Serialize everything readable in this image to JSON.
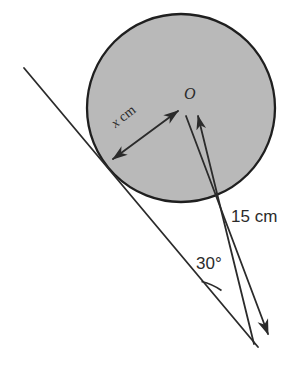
{
  "diagram": {
    "background_color": "#ffffff",
    "stroke_color": "#2b2b2b",
    "circle": {
      "name": "shaded-circle",
      "center_x": 181,
      "center_y": 108,
      "radius": 94,
      "fill_color": "#b9b9b9",
      "stroke_color": "#1f1f1f",
      "stroke_width": 2.2
    },
    "center_point": {
      "label": "O",
      "x": 185,
      "y": 110
    },
    "vertex_point": {
      "x": 255,
      "y": 345
    },
    "tangent_point": {
      "x": 110,
      "y": 162
    },
    "tangent_line": {
      "name": "tangent-line",
      "x1": 24,
      "y1": 68,
      "x2": 258,
      "y2": 347
    },
    "radius_arrow": {
      "name": "radius-x-arrow",
      "x1": 111,
      "y1": 161,
      "x2": 180,
      "y2": 109,
      "label": "x cm",
      "label_italic_part": "x",
      "label_unit_part": " cm",
      "double_headed": true
    },
    "hypotenuse_line": {
      "name": "hypotenuse-to-O",
      "x1": 254,
      "y1": 344,
      "x2": 197,
      "y2": 112,
      "label": "15 cm",
      "arrow_at_top": true
    },
    "extended_line": {
      "name": "extended-ray",
      "x1": 186,
      "y1": 114,
      "x2": 270,
      "y2": 337,
      "arrow_at_bottom": true
    },
    "angle": {
      "name": "angle-30",
      "label": "30°",
      "value": 30,
      "unit": "degrees",
      "arc_radius": 58,
      "vertex_x": 255,
      "vertex_y": 345
    },
    "labels": {
      "center": "O",
      "radius": "x cm",
      "radius_var": "x",
      "radius_unit": "cm",
      "hypotenuse": "15 cm",
      "angle": "30°"
    }
  }
}
